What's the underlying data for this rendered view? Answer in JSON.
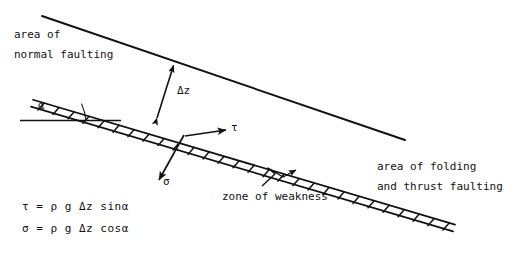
{
  "diagram": {
    "type": "geological cross-section schematic",
    "background_color": "#ffffff",
    "ink_color": "#111111",
    "labels": {
      "area_normal_1": "area of",
      "area_normal_2": "normal faulting",
      "area_thrust_1": "area of folding",
      "area_thrust_2": "and thrust faulting",
      "zone_of_weakness": "zone of weakness",
      "delta_z": "Δz",
      "alpha": "α",
      "tau": "τ",
      "sigma": "σ"
    },
    "equations": [
      "τ = ρ g Δz sinα",
      "σ = ρ g Δz cosα"
    ],
    "geometry": {
      "top_surface": {
        "x1": 42,
        "y1": 16,
        "x2": 405,
        "y2": 140
      },
      "weak_zone_band": {
        "x1": 33,
        "y1": 100,
        "x2": 455,
        "y2": 225,
        "thickness": 7,
        "hatch": "slanted ticks"
      },
      "alpha_baseline": {
        "x1": 20,
        "y1": 120,
        "x2": 120,
        "y2": 120
      },
      "delta_z_arrow": {
        "x1": 156,
        "y1": 119,
        "x2": 174,
        "y2": 64,
        "heads": "both"
      },
      "tau_arrow": {
        "x1": 185,
        "y1": 136,
        "x2": 228,
        "y2": 130,
        "heads": "end"
      },
      "sigma_arrow": {
        "x1": 184,
        "y1": 135,
        "x2": 158,
        "y2": 183,
        "heads": "end"
      },
      "zone_leader": {
        "from_x": 262,
        "from_y": 186,
        "to_x": 297,
        "to_y": 170,
        "style": "zigzag"
      }
    },
    "dip_angle_deg": 18
  }
}
